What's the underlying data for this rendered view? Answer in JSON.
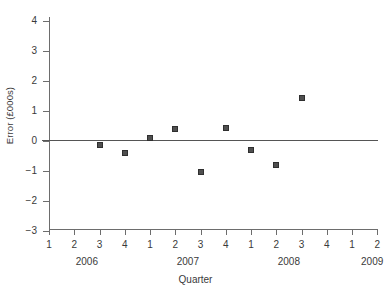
{
  "chart_data": {
    "type": "scatter",
    "title": "",
    "xlabel": "Quarter",
    "ylabel": "Error (£000s)",
    "ylim": [
      -3,
      4
    ],
    "yticks": [
      4,
      3,
      2,
      1,
      0,
      -1,
      -2,
      -3
    ],
    "ytick_labels": [
      "4",
      "3",
      "2",
      "1",
      "0",
      "−1",
      "−2",
      "−3"
    ],
    "xtick_labels": [
      "1",
      "2",
      "3",
      "4",
      "1",
      "2",
      "3",
      "4",
      "1",
      "2",
      "3",
      "4",
      "1",
      "2"
    ],
    "x_group_labels": [
      "2006",
      "2007",
      "2008",
      "2009"
    ],
    "grid": false,
    "legend": null,
    "reference_line": {
      "y": 0,
      "color": "#555555"
    },
    "marker_color": "#4f4f4f",
    "points": [
      {
        "quarter": "3",
        "year": "2006",
        "index": 2,
        "value": -0.15
      },
      {
        "quarter": "4",
        "year": "2006",
        "index": 3,
        "value": -0.4
      },
      {
        "quarter": "1",
        "year": "2007",
        "index": 4,
        "value": 0.1
      },
      {
        "quarter": "2",
        "year": "2007",
        "index": 5,
        "value": 0.37
      },
      {
        "quarter": "3",
        "year": "2007",
        "index": 6,
        "value": -1.05
      },
      {
        "quarter": "4",
        "year": "2007",
        "index": 7,
        "value": 0.43
      },
      {
        "quarter": "1",
        "year": "2008",
        "index": 8,
        "value": -0.33
      },
      {
        "quarter": "2",
        "year": "2008",
        "index": 9,
        "value": -0.82
      },
      {
        "quarter": "3",
        "year": "2008",
        "index": 10,
        "value": 1.42
      }
    ]
  }
}
